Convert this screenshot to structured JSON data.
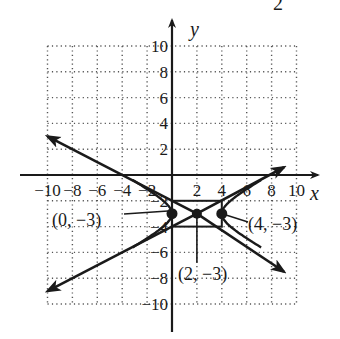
{
  "header": {
    "corner_fragment": "2"
  },
  "chart_data": {
    "type": "line",
    "title": "",
    "xlabel": "x",
    "ylabel": "y",
    "xlim": [
      -10,
      10
    ],
    "ylim": [
      -10,
      10
    ],
    "grid": true,
    "grid_step": 2,
    "x_ticks": [
      "-10",
      "-8",
      "-6",
      "-4",
      "-2",
      "2",
      "4",
      "6",
      "8",
      "10"
    ],
    "y_ticks": [
      "10",
      "8",
      "6",
      "4",
      "2",
      "-2",
      "-4",
      "-6",
      "-8",
      "-10"
    ],
    "center": {
      "x": 2,
      "y": -3,
      "label": "(2, −3)"
    },
    "vertices": [
      {
        "x": 0,
        "y": -3,
        "label": "(0, −3)"
      },
      {
        "x": 4,
        "y": -3,
        "label": "(4, −3)"
      }
    ],
    "fundamental_rectangle": {
      "x_min": 0,
      "x_max": 4,
      "y_min": -4,
      "y_max": -2
    },
    "asymptotes": [
      {
        "name": "asymptote-decreasing",
        "from": [
          -10,
          3
        ],
        "to": [
          9,
          -7.5
        ]
      },
      {
        "name": "asymptote-increasing",
        "from": [
          -10,
          -9
        ],
        "to": [
          9,
          0.6
        ]
      }
    ],
    "hyperbola_branches": [
      {
        "name": "left-branch",
        "opens": "left",
        "vertex": [
          0,
          -3
        ]
      },
      {
        "name": "right-branch",
        "opens": "right",
        "vertex": [
          4,
          -3
        ]
      }
    ]
  },
  "labels": {
    "x_axis": "x",
    "y_axis": "y",
    "vertex_left": "(0, −3)",
    "vertex_right": "(4, −3)",
    "center": "(2, −3)"
  }
}
